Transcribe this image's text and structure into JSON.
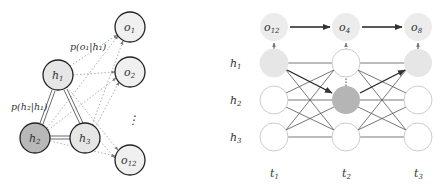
{
  "left_diagram": {
    "hidden_nodes": [
      {
        "id": "h1",
        "label": "h",
        "sub": "1",
        "x": 58,
        "y": 75,
        "fill": "#e6e6e6"
      },
      {
        "id": "h2",
        "label": "h",
        "sub": "2",
        "x": 35,
        "y": 138,
        "fill": "#b8b8b8"
      },
      {
        "id": "h3",
        "label": "h",
        "sub": "3",
        "x": 85,
        "y": 138,
        "fill": "#e6e6e6"
      }
    ],
    "observation_nodes": [
      {
        "id": "o1",
        "label": "o",
        "sub": "1",
        "x": 130,
        "y": 27
      },
      {
        "id": "o2",
        "label": "o",
        "sub": "2",
        "x": 130,
        "y": 72
      },
      {
        "id": "o12",
        "label": "o",
        "sub": "12",
        "x": 130,
        "y": 160
      }
    ],
    "ellipsis": "⋮",
    "annotations": {
      "emission": "p(o₁|h₁)",
      "transition": "p(h₂|h₁)"
    }
  },
  "right_diagram": {
    "row_labels": [
      {
        "label": "h",
        "sub": "1"
      },
      {
        "label": "h",
        "sub": "2"
      },
      {
        "label": "h",
        "sub": "3"
      }
    ],
    "time_labels": [
      {
        "label": "t",
        "sub": "1"
      },
      {
        "label": "t",
        "sub": "2"
      },
      {
        "label": "t",
        "sub": "3"
      }
    ],
    "observations": [
      {
        "label": "o",
        "sub": "12"
      },
      {
        "label": "o",
        "sub": "4"
      },
      {
        "label": "o",
        "sub": "8"
      }
    ],
    "viterbi_path": [
      "h1",
      "h2",
      "h1"
    ],
    "colors": {
      "path_light": "#e6e6e6",
      "path_dark": "#b5b5b5",
      "empty": "#ffffff",
      "obs": "#ececec"
    }
  }
}
